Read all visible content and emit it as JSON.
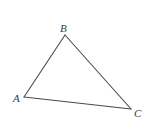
{
  "diagram": {
    "type": "triangle",
    "stroke_color": "#4a4a4a",
    "label_color": "#3a3a3a",
    "vertices": [
      {
        "name": "A",
        "x": 24,
        "y": 97,
        "label_x": 13,
        "label_y": 102
      },
      {
        "name": "B",
        "x": 65,
        "y": 35,
        "label_x": 60,
        "label_y": 32
      },
      {
        "name": "C",
        "x": 131,
        "y": 109,
        "label_x": 134,
        "label_y": 117
      }
    ],
    "edges": [
      {
        "from": "A",
        "to": "B"
      },
      {
        "from": "B",
        "to": "C"
      },
      {
        "from": "C",
        "to": "A"
      }
    ]
  }
}
